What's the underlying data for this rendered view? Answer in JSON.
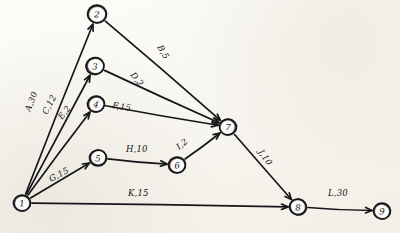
{
  "diagram": {
    "medium": "hand-drawn pencil sketch on paper",
    "paper_color": "#f7f5ef",
    "ink_color": "#16161a",
    "nodes": [
      {
        "id": "1",
        "label": "1",
        "x": 22,
        "y": 203,
        "r": 8.5
      },
      {
        "id": "2",
        "label": "2",
        "x": 97,
        "y": 14,
        "r": 9.5
      },
      {
        "id": "3",
        "label": "3",
        "x": 95,
        "y": 66,
        "r": 9.0
      },
      {
        "id": "4",
        "label": "4",
        "x": 96,
        "y": 104,
        "r": 8.5
      },
      {
        "id": "5",
        "label": "5",
        "x": 98,
        "y": 158,
        "r": 8.5
      },
      {
        "id": "6",
        "label": "6",
        "x": 177,
        "y": 165,
        "r": 8.5
      },
      {
        "id": "7",
        "label": "7",
        "x": 228,
        "y": 127,
        "r": 8.5
      },
      {
        "id": "8",
        "label": "8",
        "x": 298,
        "y": 207,
        "r": 8.5
      },
      {
        "id": "9",
        "label": "9",
        "x": 382,
        "y": 211,
        "r": 8.5
      }
    ],
    "edges": [
      {
        "id": "A",
        "from": "1",
        "to": "2",
        "activity": "A",
        "duration": "30",
        "label": "A,30",
        "label_x": 30,
        "label_y": 112,
        "label_rot": -68
      },
      {
        "id": "B",
        "from": "2",
        "to": "7",
        "activity": "B",
        "duration": "5",
        "label": "B,5",
        "label_x": 157,
        "label_y": 47,
        "label_rot": 60
      },
      {
        "id": "C",
        "from": "1",
        "to": "3",
        "activity": "C",
        "duration": "12",
        "label": "C,12",
        "label_x": 47,
        "label_y": 115,
        "label_rot": -62
      },
      {
        "id": "D",
        "from": "3",
        "to": "7",
        "activity": "D",
        "duration": "2",
        "label": "D,2",
        "label_x": 130,
        "label_y": 75,
        "label_rot": 52
      },
      {
        "id": "E",
        "from": "1",
        "to": "4",
        "activity": "E",
        "duration": "2",
        "label": "E,2",
        "label_x": 62,
        "label_y": 120,
        "label_rot": -52
      },
      {
        "id": "F",
        "from": "4",
        "to": "7",
        "activity": "F",
        "duration": "15",
        "label": "F,15",
        "label_x": 112,
        "label_y": 108,
        "label_rot": 9
      },
      {
        "id": "G",
        "from": "1",
        "to": "5",
        "activity": "G",
        "duration": "15",
        "label": "G,15",
        "label_x": 51,
        "label_y": 182,
        "label_rot": -28
      },
      {
        "id": "H",
        "from": "5",
        "to": "6",
        "activity": "H",
        "duration": "10",
        "label": "H,10",
        "label_x": 126,
        "label_y": 152,
        "label_rot": 0
      },
      {
        "id": "I",
        "from": "6",
        "to": "7",
        "activity": "I",
        "duration": "2",
        "label": "I,2",
        "label_x": 179,
        "label_y": 150,
        "label_rot": -38
      },
      {
        "id": "J",
        "from": "7",
        "to": "8",
        "activity": "J",
        "duration": "10",
        "label": "J,10",
        "label_x": 258,
        "label_y": 152,
        "label_rot": 55
      },
      {
        "id": "K",
        "from": "1",
        "to": "8",
        "activity": "K",
        "duration": "15",
        "label": "K,15",
        "label_x": 128,
        "label_y": 196,
        "label_rot": 0
      },
      {
        "id": "L",
        "from": "8",
        "to": "9",
        "activity": "L",
        "duration": "30",
        "label": "L,30",
        "label_x": 328,
        "label_y": 196,
        "label_rot": 0
      }
    ]
  }
}
